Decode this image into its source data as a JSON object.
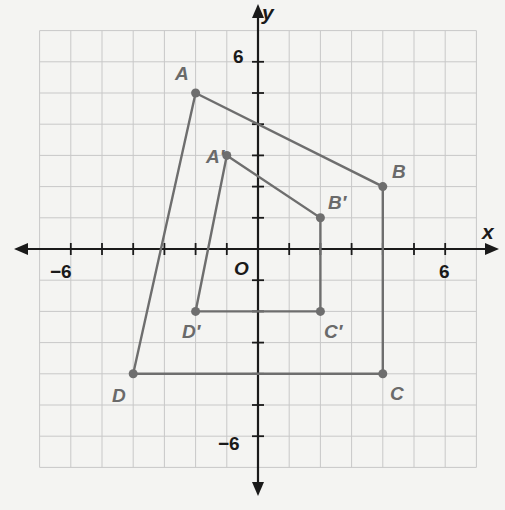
{
  "axes": {
    "x_label": "x",
    "y_label": "y",
    "origin_label": "O",
    "tick_labels": {
      "x_neg": "−6",
      "x_pos": "6",
      "y_pos": "6",
      "y_neg": "−6"
    },
    "range": {
      "xmin": -7,
      "xmax": 7,
      "ymin": -7,
      "ymax": 7
    }
  },
  "figures": {
    "original": {
      "name": "ABCD",
      "vertices": [
        {
          "label": "A",
          "x": -2,
          "y": 5
        },
        {
          "label": "B",
          "x": 4,
          "y": 2
        },
        {
          "label": "C",
          "x": 4,
          "y": -4
        },
        {
          "label": "D",
          "x": -4,
          "y": -4
        }
      ]
    },
    "image": {
      "name": "A'B'C'D'",
      "vertices": [
        {
          "label": "A′",
          "x": -1,
          "y": 3
        },
        {
          "label": "B′",
          "x": 2,
          "y": 1
        },
        {
          "label": "C′",
          "x": 2,
          "y": -2
        },
        {
          "label": "D′",
          "x": -2,
          "y": -2
        }
      ]
    }
  },
  "colors": {
    "figure": "#6e6e6e",
    "axis": "#1a1a1a",
    "grid": "#c8c8c8"
  }
}
